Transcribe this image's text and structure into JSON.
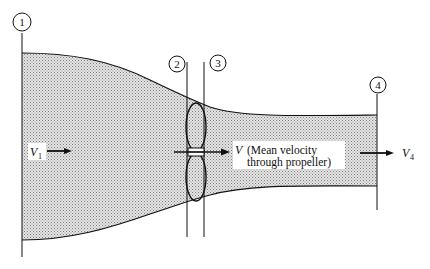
{
  "diagram": {
    "type": "propeller-streamtube",
    "colors": {
      "stream_fill": "#cfcfcf",
      "stroke": "#111111",
      "background": "#ffffff",
      "label_bg": "#ffffff"
    },
    "stations": [
      {
        "id": "1",
        "label": "1"
      },
      {
        "id": "2",
        "label": "2"
      },
      {
        "id": "3",
        "label": "3"
      },
      {
        "id": "4",
        "label": "4"
      }
    ],
    "velocities": {
      "v1": {
        "symbol": "V",
        "subscript": "1"
      },
      "v_prop": {
        "symbol": "V",
        "note_line1": "(Mean velocity",
        "note_line2": "through propeller)"
      },
      "v4": {
        "symbol": "V",
        "subscript": "4"
      }
    }
  }
}
